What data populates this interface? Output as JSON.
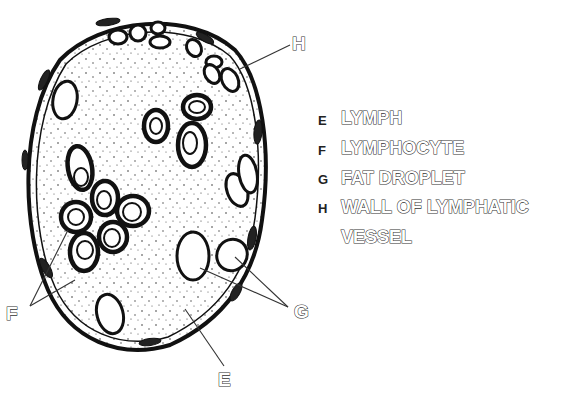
{
  "diagram": {
    "labels_on_figure": {
      "F": "F",
      "G": "G",
      "E": "E",
      "H": "H"
    },
    "key": [
      {
        "letter": "E",
        "term": "LYMPH"
      },
      {
        "letter": "F",
        "term": "LYMPHOCYTE"
      },
      {
        "letter": "G",
        "term": "FAT DROPLET"
      },
      {
        "letter": "H",
        "term": "WALL OF LYMPHATIC",
        "term_line2": "VESSEL"
      }
    ],
    "colors": {
      "ink": "#111111",
      "background": "#ffffff",
      "label_outline": "#333333"
    }
  }
}
